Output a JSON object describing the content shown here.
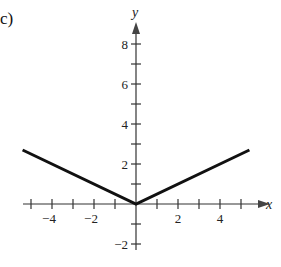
{
  "part_label": "c)",
  "chart_data": {
    "type": "line",
    "title": "",
    "xlabel": "x",
    "ylabel": "y",
    "xlim": [
      -5.4,
      5.9
    ],
    "ylim": [
      -2.3,
      9.1
    ],
    "x_ticks": [
      -5,
      -4,
      -3,
      -2,
      -1,
      1,
      2,
      3,
      4,
      5
    ],
    "x_tick_labels": [
      {
        "value": -4,
        "label": "−4"
      },
      {
        "value": -2,
        "label": "−2"
      },
      {
        "value": 2,
        "label": "2"
      },
      {
        "value": 4,
        "label": "4"
      }
    ],
    "y_ticks": [
      -2,
      -1,
      1,
      2,
      3,
      4,
      5,
      6,
      7,
      8
    ],
    "y_tick_labels": [
      {
        "value": 8,
        "label": "8"
      },
      {
        "value": 6,
        "label": "6"
      },
      {
        "value": 4,
        "label": "4"
      },
      {
        "value": 2,
        "label": "2"
      },
      {
        "value": -2,
        "label": "−2"
      }
    ],
    "grid": false,
    "legend": null,
    "series": [
      {
        "name": "y = |x| / 2",
        "x": [
          -5.4,
          0,
          5.4
        ],
        "y": [
          2.7,
          0,
          2.7
        ]
      }
    ]
  }
}
